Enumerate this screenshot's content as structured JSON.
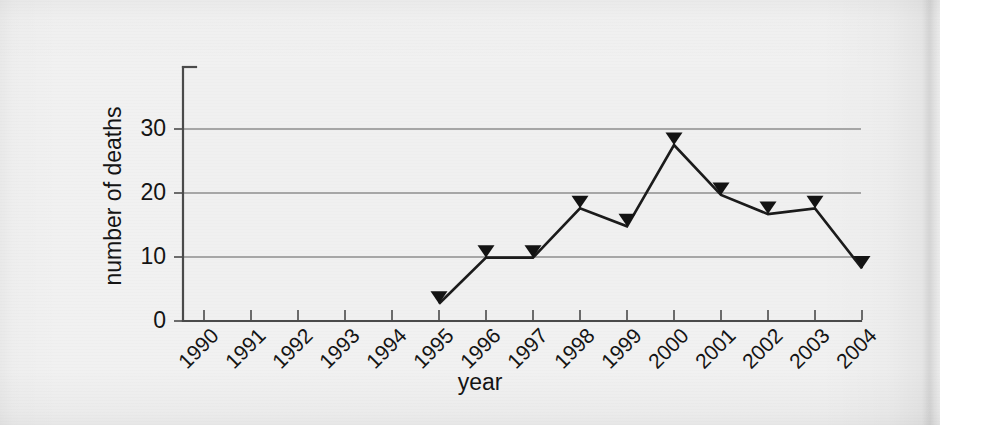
{
  "figure": {
    "background_color": "#f1f1f1",
    "plot_background_color": "#eeeeee",
    "axis_color": "#4a4a4a",
    "grid_color": "#8e8e8e",
    "series_color": "#1b1b1b"
  },
  "axes": {
    "y_title": "number of deaths",
    "x_title": "year",
    "y_ticks": [
      "0",
      "10",
      "20",
      "30"
    ],
    "x_ticks": [
      "1990",
      "1991",
      "1992",
      "1993",
      "1994",
      "1995",
      "1996",
      "1997",
      "1998",
      "1999",
      "2000",
      "2001",
      "2002",
      "2003",
      "2004"
    ]
  },
  "chart_data": {
    "type": "line",
    "title": "",
    "subtitle": "",
    "xlabel": "year",
    "ylabel": "number of deaths",
    "categories": [
      "1990",
      "1991",
      "1992",
      "1993",
      "1994",
      "1995",
      "1996",
      "1997",
      "1998",
      "1999",
      "2000",
      "2001",
      "2002",
      "2003",
      "2004"
    ],
    "x": [
      1990,
      1991,
      1992,
      1993,
      1994,
      1995,
      1996,
      1997,
      1998,
      1999,
      2000,
      2001,
      2002,
      2003,
      2004
    ],
    "values": [
      null,
      null,
      null,
      null,
      null,
      2.7,
      9.9,
      9.9,
      17.6,
      14.8,
      27.5,
      19.7,
      16.7,
      17.6,
      8.2
    ],
    "series": [
      {
        "name": "number of deaths",
        "points": [
          {
            "x": "1995",
            "y": 2.7
          },
          {
            "x": "1996",
            "y": 9.9
          },
          {
            "x": "1997",
            "y": 9.9
          },
          {
            "x": "1998",
            "y": 17.6
          },
          {
            "x": "1999",
            "y": 14.8
          },
          {
            "x": "2000",
            "y": 27.5
          },
          {
            "x": "2001",
            "y": 19.7
          },
          {
            "x": "2002",
            "y": 16.7
          },
          {
            "x": "2003",
            "y": 17.6
          },
          {
            "x": "2004",
            "y": 8.2
          }
        ],
        "marker": "triangle-down",
        "color": "#1b1b1b"
      }
    ],
    "xlim": [
      1989.55,
      2004.45
    ],
    "ylim": [
      0,
      39.7
    ],
    "yticks": [
      0,
      10,
      20,
      30
    ],
    "grid": "horizontal",
    "grid_values": [
      10,
      20,
      30
    ],
    "legend": "none",
    "annotations": []
  }
}
